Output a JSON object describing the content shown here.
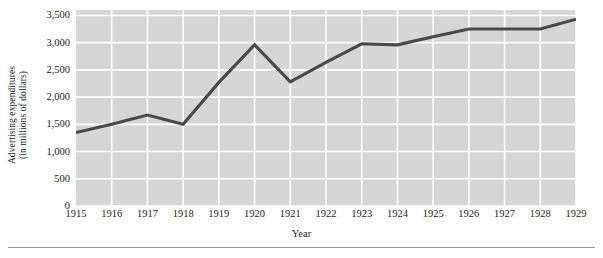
{
  "chart_data": {
    "type": "line",
    "title": "",
    "xlabel": "Year",
    "ylabel": "Advertising expenditures (in millions of dollars)",
    "ylabel_line1": "Advertising expenditures",
    "ylabel_line2": "(in millions of dollars)",
    "categories": [
      "1915",
      "1916",
      "1917",
      "1918",
      "1919",
      "1920",
      "1921",
      "1922",
      "1923",
      "1924",
      "1925",
      "1926",
      "1927",
      "1928",
      "1929"
    ],
    "x": [
      1915,
      1916,
      1917,
      1918,
      1919,
      1920,
      1921,
      1922,
      1923,
      1924,
      1925,
      1926,
      1927,
      1928,
      1929
    ],
    "values": [
      1350,
      1500,
      1670,
      1500,
      2270,
      2960,
      2280,
      2640,
      2980,
      2960,
      3110,
      3250,
      3250,
      3250,
      3430
    ],
    "series": [
      {
        "name": "Advertising expenditures",
        "values": [
          1350,
          1500,
          1670,
          1500,
          2270,
          2960,
          2280,
          2640,
          2980,
          2960,
          3110,
          3250,
          3250,
          3250,
          3430
        ]
      }
    ],
    "ylim": [
      0,
      3600
    ],
    "yticks": [
      0,
      500,
      1000,
      1500,
      2000,
      2500,
      3000,
      3500
    ],
    "ytick_labels": [
      "0",
      "500",
      "1,000",
      "1,500",
      "2,000",
      "2,500",
      "3,000",
      "3,500"
    ],
    "xlim": [
      1915,
      1929
    ],
    "grid": true,
    "grid_color": "#ffffff",
    "plot_background": "#d6d6d6",
    "line_color": "#4a4a4a",
    "legend": null,
    "legend_position": "none",
    "annotations": []
  }
}
